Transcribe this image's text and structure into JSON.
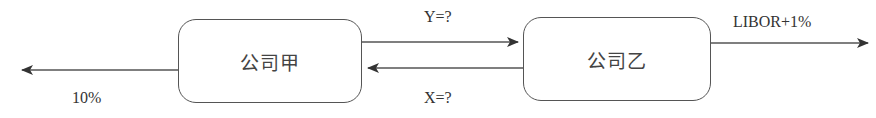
{
  "diagram": {
    "type": "interest-rate-swap-flow",
    "nodes": [
      {
        "id": "company_a",
        "label": "公司甲"
      },
      {
        "id": "company_b",
        "label": "公司乙"
      }
    ],
    "edges": [
      {
        "from": "company_a",
        "to": "external_left",
        "label": "10%"
      },
      {
        "from": "company_a",
        "to": "company_b",
        "label": "Y=?"
      },
      {
        "from": "company_b",
        "to": "company_a",
        "label": "X=?"
      },
      {
        "from": "company_b",
        "to": "external_right",
        "label": "LIBOR+1%"
      }
    ]
  },
  "labels": {
    "box_a": "公司甲",
    "box_b": "公司乙",
    "left_out": "10%",
    "y_flow": "Y=?",
    "x_flow": "X=?",
    "right_out": "LIBOR+1%"
  },
  "colors": {
    "line": "#555555",
    "text": "#333333",
    "background": "#ffffff"
  }
}
